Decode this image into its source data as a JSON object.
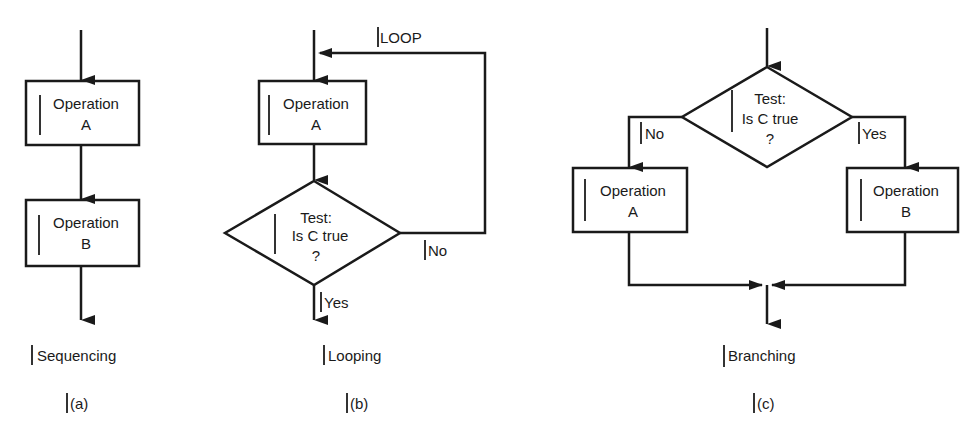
{
  "panels": {
    "a": {
      "caption": "Sequencing",
      "label": "(a)",
      "box1": {
        "line1": "Operation",
        "line2": "A"
      },
      "box2": {
        "line1": "Operation",
        "line2": "B"
      }
    },
    "b": {
      "caption": "Looping",
      "label": "(b)",
      "loop_label": "LOOP",
      "box1": {
        "line1": "Operation",
        "line2": "A"
      },
      "test": {
        "line1": "Test:",
        "line2": "Is C true",
        "line3": "?"
      },
      "no_label": "No",
      "yes_label": "Yes"
    },
    "c": {
      "caption": "Branching",
      "label": "(c)",
      "test": {
        "line1": "Test:",
        "line2": "Is C true",
        "line3": "?"
      },
      "no_label": "No",
      "yes_label": "Yes",
      "box_left": {
        "line1": "Operation",
        "line2": "A"
      },
      "box_right": {
        "line1": "Operation",
        "line2": "B"
      }
    }
  },
  "colors": {
    "stroke": "#1a1a1a",
    "background": "#ffffff"
  }
}
